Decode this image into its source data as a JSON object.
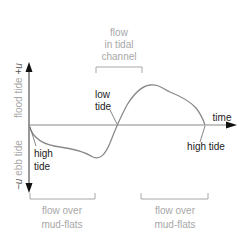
{
  "diagram": {
    "axes": {
      "x_label": "time",
      "y_positive_label": "flood tide +u",
      "y_positive_text": "flood tide",
      "y_positive_symbol": "+u",
      "y_negative_label": "−u ebb tide",
      "y_negative_text": "ebb tide",
      "y_negative_symbol": "−u"
    },
    "annotations": {
      "high_tide_left_line1": "high",
      "high_tide_left_line2": "tide",
      "low_tide_line1": "low",
      "low_tide_line2": "tide",
      "high_tide_right": "high tide"
    },
    "brackets": {
      "top": {
        "line1": "flow",
        "line2": "in tidal",
        "line3": "channel"
      },
      "bottom_left": {
        "line1": "flow over",
        "line2": "mud-flats"
      },
      "bottom_right": {
        "line1": "flow over",
        "line2": "mud-flats"
      }
    },
    "colors": {
      "axis": "#555555",
      "curve": "#8a8a8a",
      "bracket": "#a8a8a8",
      "dark_text": "#222222",
      "light_text": "#a8a8a8"
    }
  }
}
